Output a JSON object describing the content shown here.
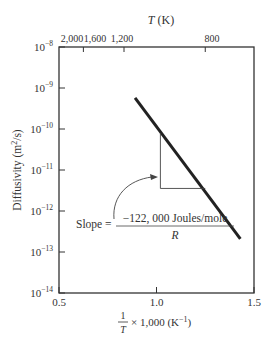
{
  "chart_data": {
    "type": "line",
    "title": "",
    "xlabel": "1/T × 1,000 (K⁻¹)",
    "ylabel": "Diffusivity (m²/s)",
    "top_axis_label": "T (K)",
    "xlim": [
      0.5,
      1.5
    ],
    "ylim_log10": [
      -14,
      -8
    ],
    "yscale": "log",
    "grid": false,
    "x_ticks": [
      {
        "value": 0.5,
        "label": "0.5"
      },
      {
        "value": 1.0,
        "label": "1.0"
      },
      {
        "value": 1.5,
        "label": "1.5"
      }
    ],
    "y_ticks": [
      {
        "exp": -8,
        "base": "10",
        "sup": "−8"
      },
      {
        "exp": -9,
        "base": "10",
        "sup": "−9"
      },
      {
        "exp": -10,
        "base": "10",
        "sup": "−10"
      },
      {
        "exp": -11,
        "base": "10",
        "sup": "−11"
      },
      {
        "exp": -12,
        "base": "10",
        "sup": "−12"
      },
      {
        "exp": -13,
        "base": "10",
        "sup": "−13"
      },
      {
        "exp": -14,
        "base": "10",
        "sup": "−14"
      }
    ],
    "top_ticks": [
      {
        "T": 2000,
        "label": "2,000"
      },
      {
        "T": 1600,
        "label": "1,600"
      },
      {
        "T": 1200,
        "label": "1,200"
      },
      {
        "T": 800,
        "label": "800"
      }
    ],
    "series": [
      {
        "name": "Diffusivity",
        "x": [
          0.89,
          1.43
        ],
        "log10_y": [
          -9.24,
          -12.68
        ]
      }
    ],
    "annotation": {
      "slope_prefix": "Slope =",
      "numerator": "−122, 000 Joules/mole",
      "denominator": "R",
      "triangle": {
        "x": [
          1.02,
          1.25
        ],
        "log10_y": [
          -10.1,
          -11.45
        ]
      }
    }
  }
}
